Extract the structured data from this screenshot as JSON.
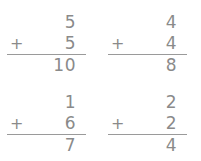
{
  "worksheet": {
    "background_color": "#ffffff",
    "ink_color": "#8a8a8a",
    "rule_color": "#9a9a9a",
    "operator_symbol": "+",
    "problems": [
      {
        "id": "problem-1",
        "position": "top-left",
        "top_addend": "5",
        "operator": "+",
        "bottom_addend": "5",
        "answer": "10"
      },
      {
        "id": "problem-2",
        "position": "top-right",
        "top_addend": "4",
        "operator": "+",
        "bottom_addend": "4",
        "answer": "8"
      },
      {
        "id": "problem-3",
        "position": "bottom-left",
        "top_addend": "1",
        "operator": "+",
        "bottom_addend": "6",
        "answer": "7"
      },
      {
        "id": "problem-4",
        "position": "bottom-right",
        "top_addend": "2",
        "operator": "+",
        "bottom_addend": "2",
        "answer": "4"
      }
    ]
  }
}
